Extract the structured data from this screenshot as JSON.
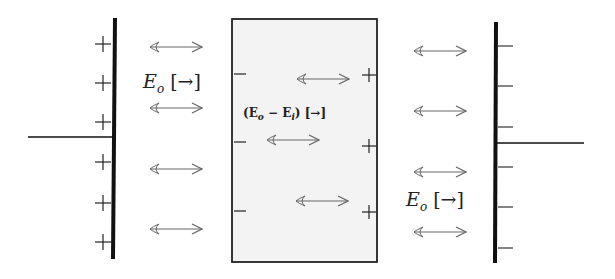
{
  "diagram": {
    "left_plate": {
      "charge_sign": "+",
      "charge_count": 6
    },
    "right_plate": {
      "charge_sign": "−",
      "charge_count": 6
    },
    "slab": {
      "left_charges": "−",
      "right_charges": "+",
      "charge_count": 3,
      "fill": "#f3f3f3"
    },
    "labels": {
      "outside_left": "E",
      "outside_left_sub": "o",
      "outside_left_dir": "[→]",
      "inside": "(E",
      "inside_sub1": "o",
      "inside_mid": " − E",
      "inside_sub2": "i",
      "inside_end": ") [→]",
      "outside_right": "E",
      "outside_right_sub": "o",
      "outside_right_dir": "[→]"
    },
    "colors": {
      "line": "#111111",
      "arrow": "#666666"
    }
  }
}
